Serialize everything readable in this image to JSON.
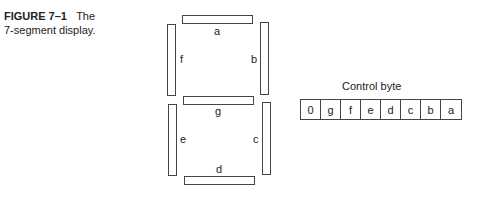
{
  "caption": {
    "figure_label": "FIGURE 7–1",
    "title_line1": "The",
    "title_line2": "7-segment display."
  },
  "segments": {
    "a": "a",
    "b": "b",
    "c": "c",
    "d": "d",
    "e": "e",
    "f": "f",
    "g": "g"
  },
  "control_byte": {
    "title": "Control byte",
    "bits": [
      "0",
      "g",
      "f",
      "e",
      "d",
      "c",
      "b",
      "a"
    ]
  }
}
